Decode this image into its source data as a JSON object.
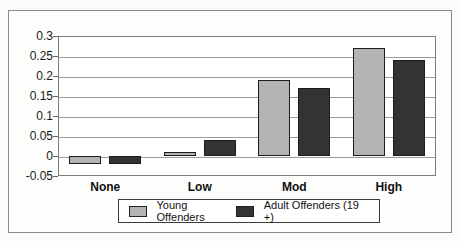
{
  "chart_data": {
    "type": "bar",
    "title": "",
    "xlabel": "",
    "ylabel": "",
    "categories": [
      "None",
      "Low",
      "Mod",
      "High"
    ],
    "series": [
      {
        "name": "Young Offenders",
        "color": "#b3b3b3",
        "values": [
          -0.02,
          0.01,
          0.19,
          0.27
        ]
      },
      {
        "name": "Adult Offenders (19 +)",
        "color": "#333333",
        "values": [
          -0.02,
          0.04,
          0.17,
          0.24
        ]
      }
    ],
    "ylim": [
      -0.05,
      0.3
    ],
    "ytick_step": 0.05,
    "ytick_labels": [
      "0.3",
      "0.25",
      "0.2",
      "0.15",
      "0.1",
      "0.05",
      "0",
      "-0.05"
    ],
    "grid": true,
    "legend_position": "bottom"
  },
  "colors": {
    "background": "#fbfbfa",
    "plot_background": "#ffffff",
    "gridline": "#9a9a9a",
    "frame_border": "#8a8a8a",
    "bar_border": "#1c1c1c",
    "text": "#111111"
  }
}
